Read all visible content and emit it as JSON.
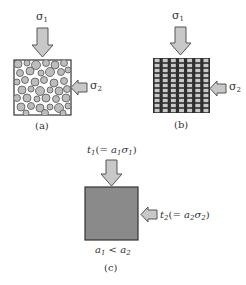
{
  "panels": {
    "a": {
      "caption": "(a)",
      "top_load": {
        "symbol": "σ",
        "sub": "1"
      },
      "side_load": {
        "symbol": "σ",
        "sub": "2"
      },
      "material": "granular-particles"
    },
    "b": {
      "caption": "(b)",
      "top_load": {
        "symbol": "σ",
        "sub": "1"
      },
      "side_load": {
        "symbol": "σ",
        "sub": "2"
      },
      "material": "grid-lattice"
    },
    "c": {
      "caption": "(c)",
      "top_load": {
        "t": "t",
        "t_sub": "1",
        "eq_open": "(= ",
        "a": "a",
        "a_sub": "1",
        "s": "σ",
        "s_sub": "1",
        "eq_close": ")"
      },
      "side_load": {
        "t": "t",
        "t_sub": "2",
        "eq_open": "(= ",
        "a": "a",
        "a_sub": "2",
        "s": "σ",
        "s_sub": "2",
        "eq_close": ")"
      },
      "condition": {
        "a1": "a",
        "a1_sub": "1",
        "op": " < ",
        "a2": "a",
        "a2_sub": "2"
      },
      "material": "homogenized-solid"
    }
  },
  "colors": {
    "arrow_fill": "#c8c8c8",
    "arrow_stroke": "#555555",
    "box_stroke": "#333333",
    "particle_fill": "#bdbdbd",
    "particle_stroke": "#555555",
    "grid_dark": "#2e2e2e",
    "grid_cell": "#c9c9c9",
    "solid_fill": "#8a8a8a"
  }
}
